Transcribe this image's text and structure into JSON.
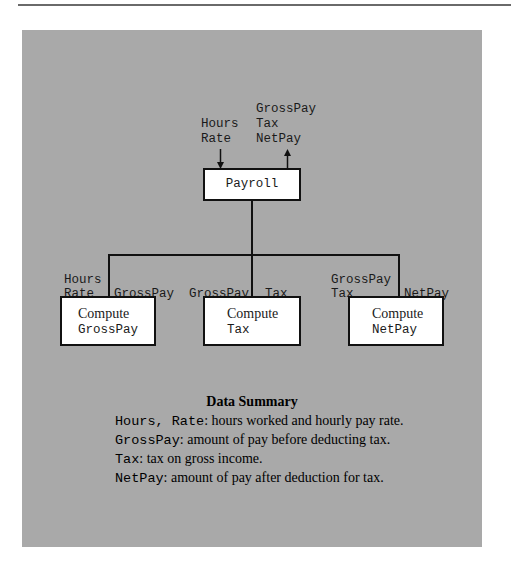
{
  "diagram": {
    "top_module": {
      "label": "Payroll",
      "inputs": [
        "Hours",
        "Rate"
      ],
      "outputs": [
        "GrossPay",
        "Tax",
        "NetPay"
      ]
    },
    "sub_modules": [
      {
        "line1": "Compute",
        "line2": "GrossPay",
        "inputs": [
          "Hours",
          "Rate"
        ],
        "outputs": [
          "GrossPay"
        ]
      },
      {
        "line1": "Compute",
        "line2": "Tax",
        "inputs": [
          "GrossPay"
        ],
        "outputs": [
          "Tax"
        ]
      },
      {
        "line1": "Compute",
        "line2": "NetPay",
        "inputs": [
          "GrossPay",
          "Tax"
        ],
        "outputs": [
          "NetPay"
        ]
      }
    ]
  },
  "summary": {
    "title": "Data Summary",
    "entries": [
      {
        "term": "Hours, Rate",
        "desc": ": hours worked and hourly pay rate."
      },
      {
        "term": "GrossPay",
        "desc": ": amount of pay before deducting tax."
      },
      {
        "term": "Tax",
        "desc": ": tax on gross income."
      },
      {
        "term": "NetPay",
        "desc": ": amount of pay after deduction for tax."
      }
    ]
  },
  "colors": {
    "panel": "#a9a9a9",
    "box": "#ffffff",
    "stroke": "#111111"
  }
}
